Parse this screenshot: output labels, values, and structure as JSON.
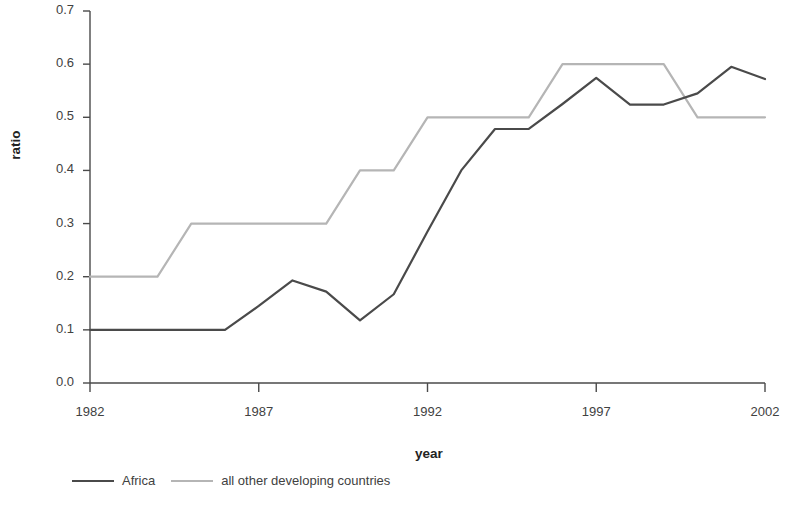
{
  "chart_data": {
    "type": "line",
    "title": "",
    "xlabel": "year",
    "ylabel": "ratio",
    "xlim": [
      1982,
      2002
    ],
    "ylim": [
      0.0,
      0.7
    ],
    "grid": false,
    "legend_position": "bottom-left",
    "x": [
      1982,
      1983,
      1984,
      1985,
      1986,
      1987,
      1988,
      1989,
      1990,
      1991,
      1992,
      1993,
      1994,
      1995,
      1996,
      1997,
      1998,
      1999,
      2000,
      2001,
      2002
    ],
    "xticks": [
      "1982",
      "1987",
      "1992",
      "1997",
      "2002"
    ],
    "xtick_values": [
      1982,
      1987,
      1992,
      1997,
      2002
    ],
    "yticks": [
      "0.0",
      "0.1",
      "0.2",
      "0.3",
      "0.4",
      "0.5",
      "0.6",
      "0.7"
    ],
    "ytick_values": [
      0.0,
      0.1,
      0.2,
      0.3,
      0.4,
      0.5,
      0.6,
      0.7
    ],
    "series": [
      {
        "name": "Africa",
        "color": "#4a4a4a",
        "line_width": 2.2,
        "values": [
          0.1,
          0.1,
          0.1,
          0.1,
          0.1,
          0.145,
          0.193,
          0.172,
          0.118,
          0.167,
          0.285,
          0.4,
          0.478,
          0.478,
          0.525,
          0.574,
          0.524,
          0.524,
          0.545,
          0.595,
          0.572
        ]
      },
      {
        "name": "all other developing countries",
        "color": "#b5b5b5",
        "line_width": 2.2,
        "values": [
          0.2,
          0.2,
          0.2,
          0.3,
          0.3,
          0.3,
          0.3,
          0.3,
          0.4,
          0.4,
          0.5,
          0.5,
          0.5,
          0.5,
          0.6,
          0.6,
          0.6,
          0.6,
          0.5,
          0.5,
          0.5
        ]
      }
    ]
  },
  "axis": {
    "y_title": "ratio",
    "x_title": "year",
    "axis_color": "#4a4a4a"
  },
  "legend": {
    "items": [
      {
        "label": "Africa",
        "color": "#4a4a4a"
      },
      {
        "label": "all other developing countries",
        "color": "#b5b5b5"
      }
    ]
  }
}
